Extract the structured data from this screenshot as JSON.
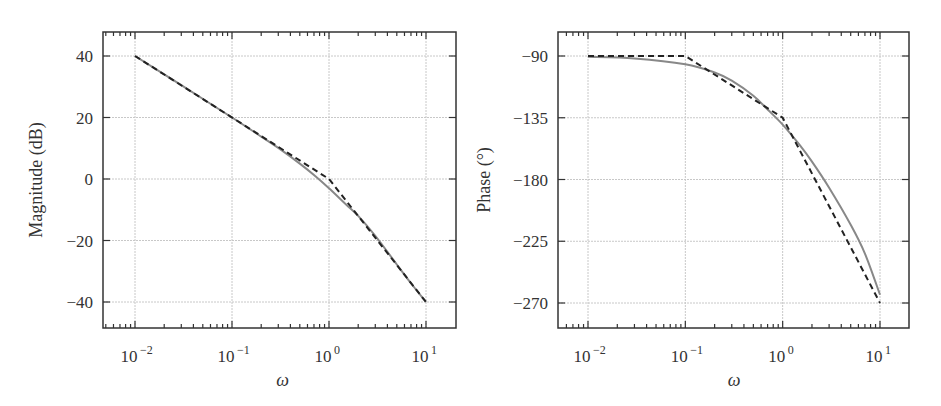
{
  "colors": {
    "exact": "#888888",
    "asymptote": "#222222",
    "grid": "#c8c8c8",
    "axis": "#333333"
  },
  "chart_data": [
    {
      "type": "line",
      "title": "",
      "xlabel": "ω",
      "ylabel": "Magnitude (dB)",
      "xscale": "log",
      "xlim": [
        0.005,
        20
      ],
      "ylim": [
        -48,
        48
      ],
      "xticks": [
        0.01,
        0.1,
        1,
        10
      ],
      "xtick_labels": [
        "10^-2",
        "10^-1",
        "10^0",
        "10^1"
      ],
      "yticks": [
        40,
        20,
        0,
        -20,
        -40
      ],
      "ytick_labels": [
        "40",
        "20",
        "0",
        "−20",
        "−40"
      ],
      "grid": true,
      "legend": null,
      "series": [
        {
          "name": "exact",
          "style": "solid-gray",
          "x": [
            0.01,
            0.03,
            0.1,
            0.2,
            0.3,
            0.5,
            0.7,
            1,
            1.5,
            2,
            3,
            5,
            7,
            10
          ],
          "y": [
            40,
            30.5,
            20,
            13.8,
            10.1,
            5.0,
            1.3,
            -3.0,
            -8.3,
            -12.0,
            -18.5,
            -27.8,
            -33.9,
            -40
          ]
        },
        {
          "name": "asymptote",
          "style": "dashed-black",
          "x": [
            0.01,
            1,
            10
          ],
          "y": [
            40,
            0,
            -40
          ]
        }
      ]
    },
    {
      "type": "line",
      "title": "",
      "xlabel": "ω",
      "ylabel": "Phase (°)",
      "xscale": "log",
      "xlim": [
        0.005,
        20
      ],
      "ylim": [
        -290,
        -70
      ],
      "xticks": [
        0.01,
        0.1,
        1,
        10
      ],
      "xtick_labels": [
        "10^-2",
        "10^-1",
        "10^0",
        "10^1"
      ],
      "yticks": [
        -90,
        -135,
        -180,
        -225,
        -270
      ],
      "ytick_labels": [
        "−90",
        "−135",
        "−180",
        "−225",
        "−270"
      ],
      "grid": true,
      "legend": null,
      "series": [
        {
          "name": "exact",
          "style": "solid-gray",
          "x": [
            0.01,
            0.03,
            0.1,
            0.2,
            0.3,
            0.5,
            0.7,
            1,
            1.5,
            2,
            3,
            5,
            7,
            10
          ],
          "y": [
            -90.6,
            -91.8,
            -96,
            -102,
            -108,
            -119,
            -129,
            -140,
            -155,
            -167,
            -186,
            -213,
            -234,
            -264
          ]
        },
        {
          "name": "asymptote",
          "style": "dashed-black",
          "x": [
            0.01,
            0.1,
            1,
            10
          ],
          "y": [
            -90,
            -90,
            -135,
            -270
          ]
        }
      ]
    }
  ],
  "plots": [
    {
      "ylabel": "Magnitude (dB)",
      "xlabel": "ω"
    },
    {
      "ylabel": "Phase (°)",
      "xlabel": "ω"
    }
  ]
}
